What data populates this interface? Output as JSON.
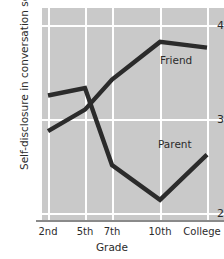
{
  "chart_data": {
    "type": "line",
    "title": "",
    "xlabel": "Grade",
    "ylabel": "Self-disclosure in conversation score",
    "categories": [
      "2nd",
      "5th",
      "7th",
      "10th",
      "College"
    ],
    "yticks": [
      2,
      3,
      4
    ],
    "ylim": [
      2,
      4
    ],
    "grid": "both",
    "legend_position": "inline-annotations",
    "series": [
      {
        "name": "Friend",
        "values": [
          2.87,
          3.1,
          3.42,
          3.82,
          3.76
        ],
        "color": "#2b2b2b"
      },
      {
        "name": "Parent",
        "values": [
          3.25,
          3.33,
          2.51,
          2.14,
          2.62
        ],
        "color": "#2b2b2b"
      }
    ]
  },
  "axis": {
    "y_tick_top": "4",
    "y_tick_mid": "3",
    "y_tick_bottom": "2",
    "y_title": "Self-disclosure in conversation score",
    "x_title": "Grade"
  },
  "xticklabels": {
    "t0": "2nd",
    "t1": "5th",
    "t2": "7th",
    "t3": "10th",
    "t4": "College"
  },
  "annotations": {
    "friend": "Friend",
    "parent": "Parent"
  },
  "colors": {
    "panel_background": "#c9c9c9",
    "gridline": "#ffffff",
    "line": "#2b2b2b",
    "axis": "#8a8a8a",
    "text": "#2b2b2b",
    "figure_background": "#ffffff"
  }
}
